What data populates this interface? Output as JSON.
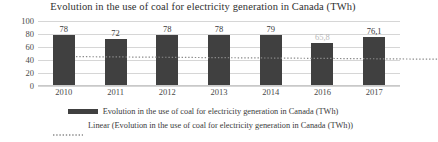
{
  "chart_data": {
    "type": "bar",
    "title": "Evolution in the use of coal for electricity generation in Canada (TWh)",
    "xlabel": "",
    "ylabel": "",
    "categories": [
      "2010",
      "2011",
      "2012",
      "2013",
      "2014",
      "2016",
      "2017"
    ],
    "values": [
      78,
      72,
      78,
      78,
      79,
      65.8,
      76.1
    ],
    "value_labels": [
      "78",
      "72",
      "78",
      "78",
      "79",
      "65,8",
      "76,1"
    ],
    "ylim": [
      0,
      100
    ],
    "yticks": [
      0,
      20,
      40,
      60,
      80,
      100
    ],
    "ytick_labels": [
      "0",
      "20",
      "40",
      "60",
      "80",
      "100"
    ],
    "grid": true,
    "legend_position": "bottom",
    "series": [
      {
        "name": "Evolution in the use of coal for electricity generation in Canada (TWh)",
        "style": "bar",
        "color": "#404040",
        "values": [
          78,
          72,
          78,
          78,
          79,
          65.8,
          76.1
        ]
      },
      {
        "name": "Linear (Evolution in the use of coal for electricity generation in Canada (TWh))",
        "style": "dotted-trendline",
        "color": "#8a8a8a",
        "trend_start": 77.5,
        "trend_end": 73.5
      }
    ]
  },
  "legend": {
    "items": [
      {
        "label": "Evolution in the use of coal for electricity generation in Canada (TWh)",
        "marker": "solid-bar-swatch"
      },
      {
        "label": "Linear (Evolution in the use of coal for electricity generation in Canada (TWh))",
        "marker": "dotted-line-swatch"
      }
    ]
  }
}
